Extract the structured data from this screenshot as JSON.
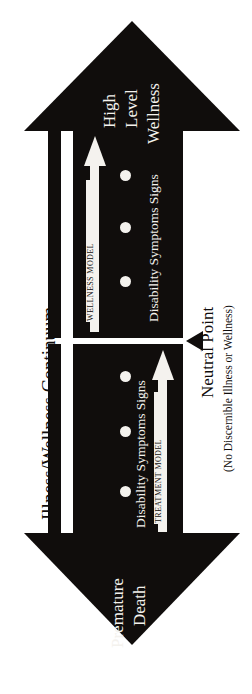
{
  "diagram": {
    "title": "Illness/Wellness Continuum",
    "orientation": "rotated-90-ccw",
    "colors": {
      "figure": "#100d0c",
      "figure_text": "#f4f2ee",
      "background": "#ffffff"
    },
    "poles": {
      "wellness": {
        "lines": [
          "High",
          "Level",
          "Wellness"
        ]
      },
      "death": {
        "lines": [
          "Premature",
          "Death"
        ]
      }
    },
    "neutral_point": {
      "title": "Neutral Point",
      "subtitle": "(No Discernible Illness or Wellness)"
    },
    "halves": [
      {
        "id": "wellness-half",
        "model_label": "WELLNESS MODEL",
        "stage_label": "Disability  Symptoms  Signs",
        "dot_count": 3
      },
      {
        "id": "illness-half",
        "model_label": "TREATMENT MODEL",
        "stage_label": "Disability  Symptoms  Signs",
        "dot_count": 3
      }
    ]
  }
}
